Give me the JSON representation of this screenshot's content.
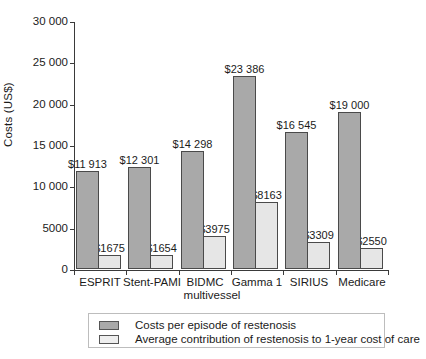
{
  "chart_data": {
    "type": "bar",
    "title": "",
    "xlabel": "",
    "ylabel": "Costs (US$)",
    "ylim": [
      0,
      30000
    ],
    "ytick_interval": 5000,
    "ytick_labels": [
      "30 000",
      "25 000",
      "20 000",
      "15 000",
      "10 000",
      "5000",
      "0"
    ],
    "ytick_values": [
      30000,
      25000,
      20000,
      15000,
      10000,
      5000,
      0
    ],
    "grid": false,
    "legend_position": "bottom",
    "categories": [
      "ESPRIT",
      "Stent-PAMI",
      "BIDMC multivessel",
      "Gamma 1",
      "SIRIUS",
      "Medicare"
    ],
    "category_lines": [
      [
        "ESPRIT"
      ],
      [
        "Stent-PAMI"
      ],
      [
        "BIDMC",
        "multivessel"
      ],
      [
        "Gamma 1"
      ],
      [
        "SIRIUS"
      ],
      [
        "Medicare"
      ]
    ],
    "series": [
      {
        "name": "Costs per episode of restenosis",
        "color": "#a9a9a9",
        "values": [
          11913,
          12301,
          14298,
          23386,
          16545,
          19000
        ],
        "labels": [
          "$11 913",
          "$12 301",
          "$14 298",
          "$23 386",
          "$16 545",
          "$19 000"
        ]
      },
      {
        "name": "Average contribution of restenosis to 1-year cost of care",
        "color": "#e6e6e6",
        "values": [
          1675,
          1654,
          3975,
          8163,
          3309,
          2550
        ],
        "labels": [
          "$1675",
          "$1654",
          "$3975",
          "$8163",
          "$3309",
          "$2550"
        ]
      }
    ]
  },
  "legend": {
    "items": [
      {
        "label": "Costs per episode of restenosis",
        "swatch": "dark"
      },
      {
        "label": "Average contribution of restenosis to 1-year cost of care",
        "swatch": "light"
      }
    ]
  }
}
